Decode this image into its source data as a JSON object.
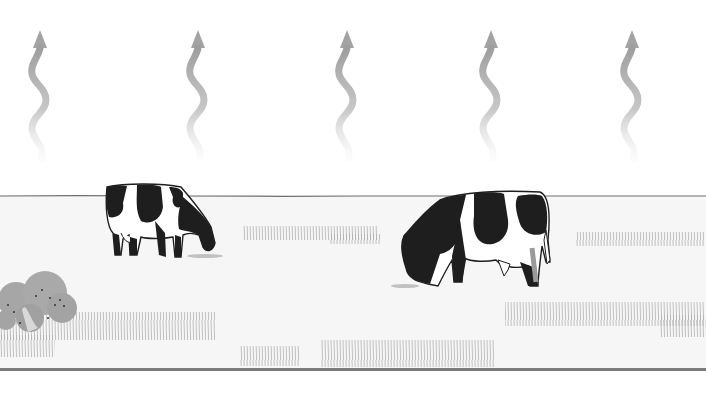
{
  "scene": {
    "description": "Two black-and-white dairy cows grazing on a pasture with wavy arrows rising into the sky",
    "colors": {
      "sky": "#ffffff",
      "field": "#f6f6f6",
      "horizon_line": "#6e6e6e",
      "ground_line": "#7a7a7a",
      "arrow": "#a9a9a9",
      "grass": "#9a9a9a",
      "bush": "#a6a6a6",
      "cow_black": "#1e1e1e",
      "cow_white": "#ffffff"
    },
    "arrows": [
      {
        "name": "rising-arrow-1",
        "x": 40
      },
      {
        "name": "rising-arrow-2",
        "x": 198
      },
      {
        "name": "rising-arrow-3",
        "x": 347
      },
      {
        "name": "rising-arrow-4",
        "x": 491
      },
      {
        "name": "rising-arrow-5",
        "x": 632
      }
    ],
    "cows": [
      {
        "name": "cow-left",
        "x": 103,
        "y": 183,
        "scale": 1.0
      },
      {
        "name": "cow-right",
        "x": 400,
        "y": 190,
        "scale": 1.3
      }
    ],
    "horizon_y": 196,
    "ground_y": 369
  }
}
